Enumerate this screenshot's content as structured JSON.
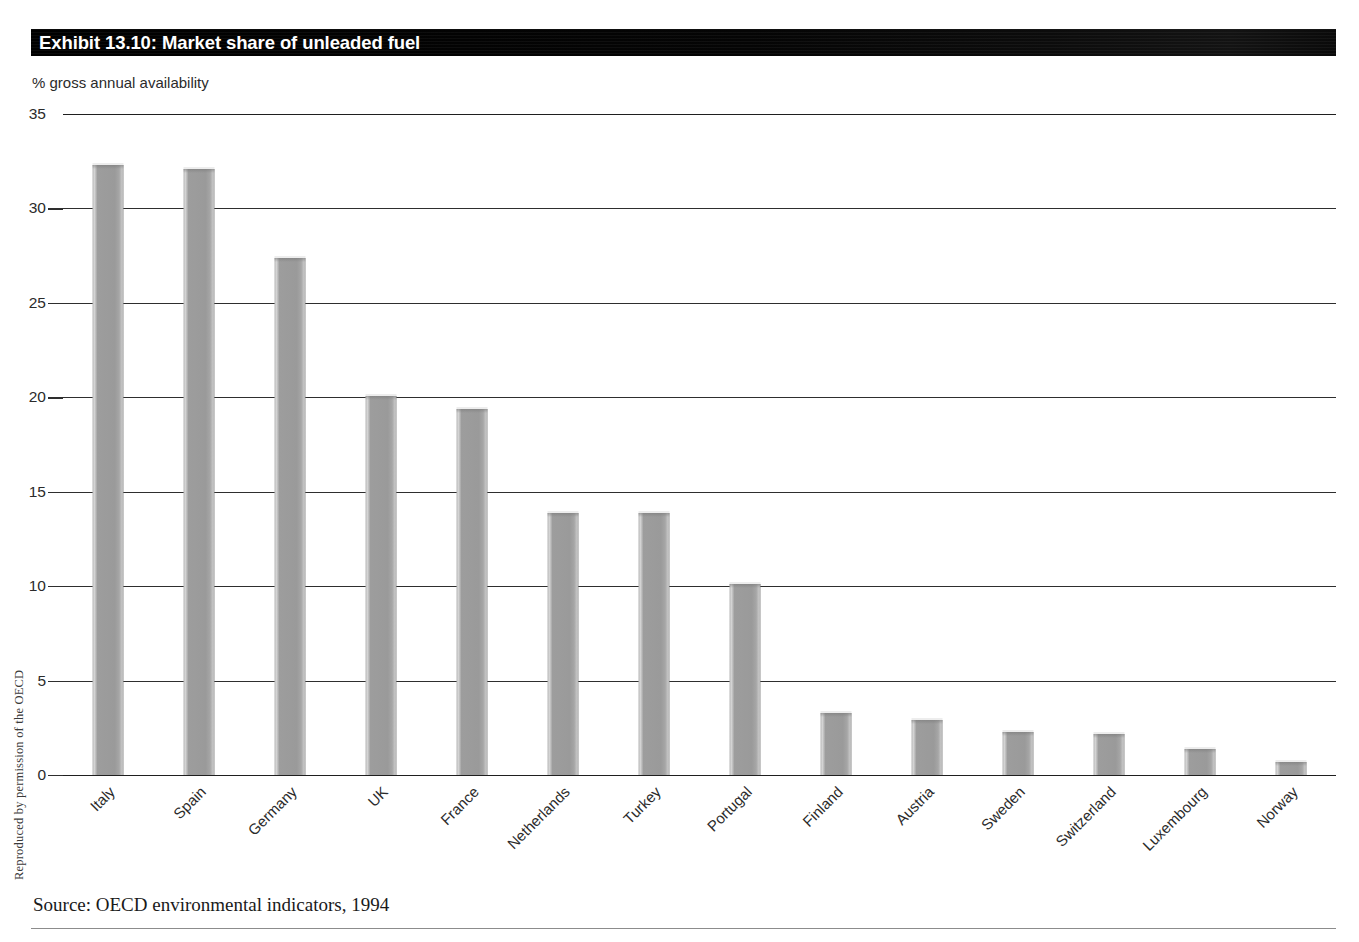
{
  "exhibit": {
    "title": "Exhibit 13.10: Market share of unleaded fuel",
    "subtitle": "% gross annual availability",
    "source": "Source: OECD environmental indicators, 1994",
    "side_credit": "Reproduced by permission of the OECD"
  },
  "colors": {
    "title_bar": "#000000",
    "title_text": "#ffffff",
    "bar_fill": "#9a9a9a",
    "bar_highlight": "#d6d6d6",
    "gridline": "#2e2e2e",
    "page_background": "#ffffff"
  },
  "chart_data": {
    "type": "bar",
    "title": "Exhibit 13.10: Market share of unleaded fuel",
    "subtitle": "% gross annual availability",
    "xlabel": "",
    "ylabel": "% gross annual availability",
    "ylim": [
      0,
      35
    ],
    "yticks": [
      0,
      5,
      10,
      15,
      20,
      25,
      30,
      35
    ],
    "ytick_labels": [
      "0",
      "5",
      "10",
      "15",
      "20",
      "25",
      "30",
      "35"
    ],
    "grid": true,
    "legend": "none",
    "categories": [
      "Italy",
      "Spain",
      "Germany",
      "UK",
      "France",
      "Netherlands",
      "Turkey",
      "Portugal",
      "Finland",
      "Austria",
      "Sweden",
      "Switzerland",
      "Luxembourg",
      "Norway"
    ],
    "values": [
      32.4,
      32.2,
      27.5,
      20.2,
      19.5,
      14.0,
      14.0,
      10.2,
      3.4,
      3.0,
      2.4,
      2.3,
      1.5,
      0.8
    ],
    "source": "Source: OECD environmental indicators, 1994"
  }
}
